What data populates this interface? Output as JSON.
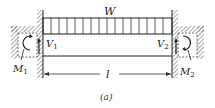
{
  "figure": {
    "caption": "(a)",
    "load_label": "W",
    "length_label": "l",
    "left_support": {
      "shear_label": "V",
      "shear_sub": "1",
      "moment_label": "M",
      "moment_sub": "1"
    },
    "right_support": {
      "shear_label": "V",
      "shear_sub": "2",
      "moment_label": "M",
      "moment_sub": "2"
    },
    "line_color": "#222222",
    "hatch_color": "#555555"
  }
}
